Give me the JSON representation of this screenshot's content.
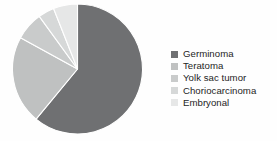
{
  "chart_data": {
    "type": "pie",
    "title": "",
    "subtitle": "",
    "xlabel": "",
    "ylabel": "",
    "grid": false,
    "legend_position": "right",
    "start_angle_deg": 0,
    "direction": "clockwise",
    "categories": [
      "Germinoma",
      "Teratoma",
      "Yolk sac tumor",
      "Choriocarcinoma",
      "Embryonal"
    ],
    "values": [
      61,
      22,
      7,
      4,
      6
    ],
    "unit": "percent",
    "colors": [
      "#6f7072",
      "#bfc1c1",
      "#c9cbcb",
      "#d6d8d8",
      "#e6e7e7"
    ],
    "slices": [
      {
        "label": "Germinoma",
        "value": 61,
        "color": "#6f7072",
        "start_deg": 0,
        "end_deg": 219.6
      },
      {
        "label": "Teratoma",
        "value": 22,
        "color": "#bfc1c1",
        "start_deg": 219.6,
        "end_deg": 298.8
      },
      {
        "label": "Yolk sac tumor",
        "value": 7,
        "color": "#c9cbcb",
        "start_deg": 298.8,
        "end_deg": 324.0
      },
      {
        "label": "Choriocarcinoma",
        "value": 4,
        "color": "#d6d8d8",
        "start_deg": 324.0,
        "end_deg": 338.4
      },
      {
        "label": "Embryonal",
        "value": 6,
        "color": "#e6e7e7",
        "start_deg": 338.4,
        "end_deg": 360.0
      }
    ]
  },
  "legend": {
    "items": [
      {
        "label": "Germinoma",
        "color": "#6f7072"
      },
      {
        "label": "Teratoma",
        "color": "#bfc1c1"
      },
      {
        "label": "Yolk sac tumor",
        "color": "#c9cbcb"
      },
      {
        "label": "Choriocarcinoma",
        "color": "#d6d8d8"
      },
      {
        "label": "Embryonal",
        "color": "#e6e7e7"
      }
    ]
  }
}
